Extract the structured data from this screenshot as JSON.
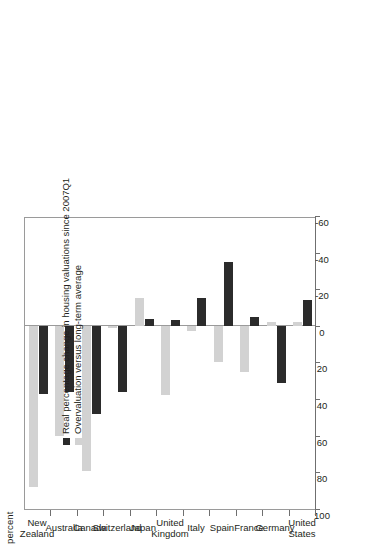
{
  "chart_data": {
    "type": "bar",
    "orientation": "horizontal",
    "title": "",
    "subtitle": "",
    "xlabel": "",
    "ylabel": "percent",
    "axis_caption": "percent",
    "categories": [
      "United States",
      "Germany",
      "France",
      "Spain",
      "Italy",
      "United Kingdom",
      "Japan",
      "Switzerland",
      "Canada",
      "Australia",
      "New Zealand"
    ],
    "category_lines": [
      [
        "United",
        "States"
      ],
      [
        "Germany"
      ],
      [
        "France"
      ],
      [
        "Spain"
      ],
      [
        "Italy"
      ],
      [
        "United",
        "Kingdom"
      ],
      [
        "Japan"
      ],
      [
        "Switzerland"
      ],
      [
        "Canada"
      ],
      [
        "Australia"
      ],
      [
        "New",
        "Zealand"
      ]
    ],
    "series": [
      {
        "name": "Real percentage change in housing valuations since 2007Q1",
        "color": "#2b2b2b",
        "values": [
          -14,
          31,
          -5,
          -35,
          -15,
          -3,
          -4,
          36,
          48,
          36,
          37
        ]
      },
      {
        "name": "Overvaluation versus long-term average",
        "color": "#d2d2d2",
        "values": [
          -2,
          -2,
          25,
          20,
          3,
          38,
          -15,
          1,
          79,
          60,
          88
        ]
      }
    ],
    "ticks": [
      100,
      80,
      60,
      40,
      20,
      0,
      -20,
      -40,
      -60
    ],
    "tick_labels": [
      "100",
      "80",
      "60",
      "40",
      "20",
      "0",
      "-20",
      "-40",
      "-60"
    ],
    "xlim": [
      100,
      -60
    ],
    "grid": false,
    "legend_position": "inside-bottom-left",
    "zero_reference": 0
  },
  "legend": {
    "items": [
      {
        "label": "Real percentage change in housing valuations since 2007Q1",
        "color": "#2b2b2b"
      },
      {
        "label": "Overvaluation versus long-term average",
        "color": "#d2d2d2"
      }
    ]
  },
  "colors": {
    "dark_series": "#2b2b2b",
    "light_series": "#d2d2d2",
    "axis": "#6f6f6f",
    "frame": "#9a9a9a",
    "text": "#231f20",
    "background": "#ffffff"
  }
}
